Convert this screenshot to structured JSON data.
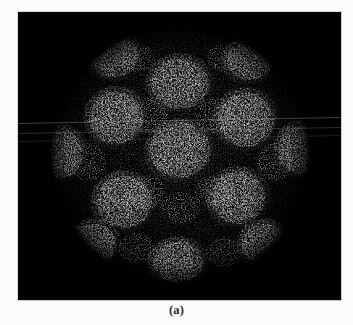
{
  "figure": {
    "caption": "(a)",
    "panel_label": "a",
    "page_background": "#fbfbfa",
    "frame_border_color": "#d2d2cf"
  },
  "micrograph": {
    "alt_text": "Three-dimensional reconstruction of an icosahedral viral capsid rendered as bright speckled density on a black background",
    "background_color": "#010101",
    "density_color": "#e8e8e8",
    "frame": {
      "x": 18,
      "y": 12,
      "width": 323,
      "height": 288
    },
    "particle": {
      "center_x": 162,
      "center_y": 143,
      "radius": 128,
      "shape": "icosahedral",
      "capsomere_count": 13
    },
    "artifacts": {
      "type": "horizontal-scanlines",
      "count": 3,
      "tilt_degrees": -1.05,
      "color": "#96989e"
    }
  }
}
